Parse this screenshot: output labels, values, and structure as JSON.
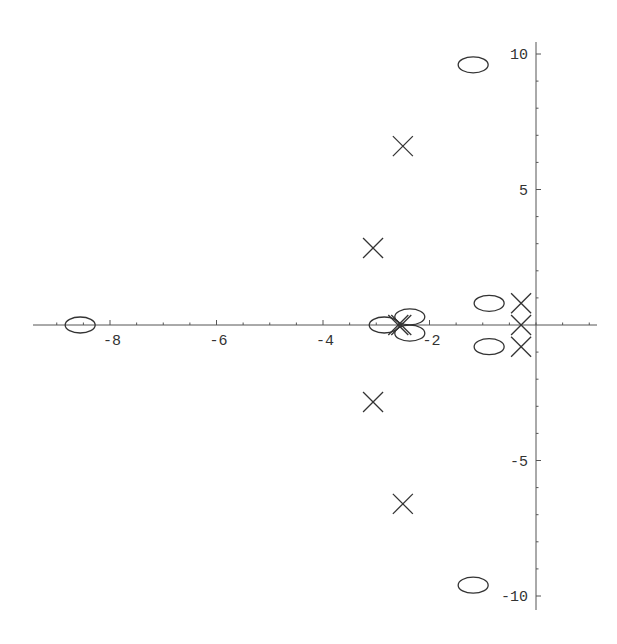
{
  "chart_data": {
    "type": "scatter",
    "title": "",
    "xlabel": "",
    "ylabel": "",
    "xlim": [
      -9.5,
      1.15
    ],
    "ylim": [
      -10.5,
      10.5
    ],
    "grid": false,
    "legend": null,
    "x_ticks": [
      -8,
      -6,
      -4,
      -2
    ],
    "x_tick_labels": [
      "-8",
      "-6",
      "-4",
      "-2"
    ],
    "y_ticks": [
      10,
      5,
      -5,
      -10
    ],
    "y_tick_labels": [
      "10",
      "5",
      "-5",
      "-10"
    ],
    "series": [
      {
        "name": "poles",
        "marker": "x",
        "points": [
          {
            "x": -2.5,
            "y": 6.6
          },
          {
            "x": -3.06,
            "y": 2.84
          },
          {
            "x": -2.53,
            "y": 0.0
          },
          {
            "x": -2.53,
            "y": 0.0
          },
          {
            "x": -3.06,
            "y": -2.84
          },
          {
            "x": -2.5,
            "y": -6.6
          },
          {
            "x": -0.28,
            "y": 0.8
          },
          {
            "x": -0.28,
            "y": 0.0
          },
          {
            "x": -0.28,
            "y": -0.8
          }
        ]
      },
      {
        "name": "zeros",
        "marker": "o",
        "points": [
          {
            "x": -1.18,
            "y": 9.6
          },
          {
            "x": -1.18,
            "y": -9.6
          },
          {
            "x": -8.56,
            "y": 0.0
          },
          {
            "x": -2.85,
            "y": 0.0
          },
          {
            "x": -2.37,
            "y": 0.3
          },
          {
            "x": -2.37,
            "y": -0.3
          },
          {
            "x": -0.88,
            "y": 0.8
          },
          {
            "x": -0.88,
            "y": -0.8
          }
        ]
      }
    ]
  },
  "layout": {
    "origin_px": [
      536,
      325
    ],
    "px_per_unit_x": 53.25,
    "px_per_unit_y": 27.1,
    "x_axis_px": [
      33,
      597
    ],
    "y_axis_px": [
      42,
      610
    ],
    "axis_color": "#555555",
    "marker_color": "#333333"
  }
}
